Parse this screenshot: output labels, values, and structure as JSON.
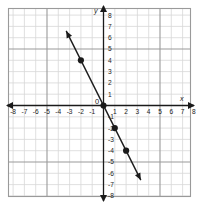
{
  "figure": {
    "title": "",
    "origin_label": "0",
    "x_axis_name": "x",
    "y_axis_name": "y"
  },
  "chart_data": {
    "type": "line",
    "title": "",
    "xlabel": "x",
    "ylabel": "y",
    "grid": true,
    "legend": "none",
    "xlim": [
      -8.5,
      8.5
    ],
    "ylim": [
      -8.5,
      8.5
    ],
    "x_ticks": [
      -8,
      -7,
      -6,
      -5,
      -4,
      -3,
      -2,
      -1,
      1,
      2,
      3,
      4,
      5,
      6,
      7,
      8
    ],
    "y_ticks": [
      -8,
      -7,
      -6,
      -5,
      -4,
      -3,
      -2,
      -1,
      1,
      2,
      3,
      4,
      5,
      6,
      7,
      8
    ],
    "x_tick_labels": [
      "-8",
      "-7",
      "-6",
      "-5",
      "-4",
      "-3",
      "-2",
      "-1",
      "1",
      "2",
      "3",
      "4",
      "5",
      "6",
      "7",
      "8"
    ],
    "y_tick_labels": [
      "-8",
      "-7",
      "-6",
      "-5",
      "-4",
      "-3",
      "-2",
      "-1",
      "1",
      "2",
      "3",
      "4",
      "5",
      "6",
      "7",
      "8"
    ],
    "series": [
      {
        "name": "line",
        "equation": "y = -2x",
        "slope": -2,
        "intercept": 0,
        "color": "#1a1a1a",
        "arrow_start": [
          -3.3,
          6.6
        ],
        "arrow_end": [
          3.3,
          -6.6
        ],
        "points": [
          {
            "x": -2,
            "y": 4
          },
          {
            "x": 0,
            "y": 0
          },
          {
            "x": 1,
            "y": -2
          },
          {
            "x": 2,
            "y": -4
          }
        ]
      }
    ]
  },
  "colors": {
    "grid_minor": "#d8d8d8",
    "grid_major": "#9a9a9a",
    "axis": "#1a1a1a",
    "line": "#1a1a1a",
    "point": "#1a1a1a",
    "background": "#ffffff"
  }
}
